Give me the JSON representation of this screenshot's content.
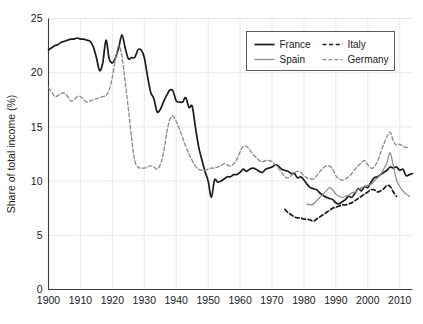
{
  "chart_data": {
    "type": "line",
    "title": "",
    "xlabel": "",
    "ylabel": "Share of total income (%)",
    "xlim": [
      1900,
      2014
    ],
    "ylim": [
      0,
      25
    ],
    "grid": true,
    "legend_position": "top-right",
    "x_ticks": [
      "1900",
      "1910",
      "1920",
      "1930",
      "1940",
      "1950",
      "1960",
      "1970",
      "1980",
      "1990",
      "2000",
      "2010"
    ],
    "y_ticks": [
      "0",
      "5",
      "10",
      "15",
      "20",
      "25"
    ],
    "legend_entries": [
      {
        "name": "France",
        "style": "solid",
        "color": "#1a1a1a"
      },
      {
        "name": "Italy",
        "style": "dashed",
        "color": "#1a1a1a"
      },
      {
        "name": "Spain",
        "style": "solid",
        "color": "#8c8c8c"
      },
      {
        "name": "Germany",
        "style": "dashed",
        "color": "#8c8c8c"
      }
    ],
    "series": [
      {
        "name": "France",
        "style": "solid",
        "color": "#1a1a1a",
        "x": [
          1900,
          1901,
          1902,
          1903,
          1904,
          1905,
          1906,
          1907,
          1908,
          1909,
          1910,
          1911,
          1912,
          1913,
          1914,
          1915,
          1916,
          1917,
          1918,
          1919,
          1920,
          1921,
          1922,
          1923,
          1924,
          1925,
          1926,
          1927,
          1928,
          1929,
          1930,
          1931,
          1932,
          1933,
          1934,
          1935,
          1936,
          1937,
          1938,
          1939,
          1940,
          1941,
          1942,
          1943,
          1944,
          1945,
          1946,
          1947,
          1948,
          1949,
          1950,
          1951,
          1952,
          1953,
          1954,
          1955,
          1956,
          1957,
          1958,
          1959,
          1960,
          1961,
          1962,
          1963,
          1964,
          1965,
          1966,
          1967,
          1968,
          1969,
          1970,
          1971,
          1972,
          1973,
          1974,
          1975,
          1976,
          1977,
          1978,
          1979,
          1980,
          1981,
          1982,
          1983,
          1984,
          1985,
          1986,
          1987,
          1988,
          1989,
          1990,
          1991,
          1992,
          1993,
          1994,
          1995,
          1996,
          1997,
          1998,
          1999,
          2000,
          2001,
          2002,
          2003,
          2004,
          2005,
          2006,
          2007,
          2008,
          2009,
          2010,
          2011,
          2012,
          2013,
          2014
        ],
        "y": [
          22.1,
          22.3,
          22.5,
          22.6,
          22.8,
          22.9,
          23.0,
          23.1,
          23.1,
          23.2,
          23.1,
          23.1,
          23.0,
          22.9,
          22.4,
          21.4,
          20.2,
          20.9,
          23.0,
          21.3,
          20.9,
          21.4,
          22.3,
          23.5,
          22.3,
          21.3,
          21.4,
          21.4,
          22.1,
          22.1,
          21.4,
          19.7,
          18.2,
          17.6,
          16.4,
          16.6,
          17.3,
          17.9,
          18.4,
          18.3,
          17.4,
          17.3,
          17.3,
          17.7,
          16.8,
          16.9,
          15.0,
          13.2,
          12.0,
          10.9,
          10.0,
          8.5,
          10.1,
          9.9,
          10.0,
          10.2,
          10.4,
          10.4,
          10.6,
          10.6,
          10.8,
          11.1,
          10.9,
          11.1,
          11.2,
          11.1,
          10.9,
          10.8,
          11.1,
          11.2,
          11.3,
          11.5,
          11.4,
          11.1,
          11.0,
          10.9,
          10.7,
          10.7,
          10.3,
          10.4,
          10.1,
          9.7,
          9.4,
          9.3,
          9.2,
          8.9,
          8.7,
          8.5,
          8.4,
          8.3,
          8.0,
          7.9,
          8.1,
          8.3,
          8.6,
          8.5,
          8.9,
          9.3,
          9.1,
          9.5,
          9.4,
          9.9,
          10.3,
          10.4,
          10.6,
          10.8,
          11.0,
          11.3,
          11.2,
          11.3,
          11.0,
          11.1,
          10.5,
          10.6,
          10.7
        ]
      },
      {
        "name": "Germany",
        "style": "dashed",
        "color": "#8c8c8c",
        "x": [
          1900,
          1901,
          1902,
          1903,
          1904,
          1905,
          1906,
          1907,
          1908,
          1909,
          1910,
          1911,
          1912,
          1913,
          1914,
          1915,
          1916,
          1917,
          1918,
          1919,
          1920,
          1921,
          1922,
          1923,
          1924,
          1925,
          1926,
          1927,
          1928,
          1929,
          1930,
          1931,
          1932,
          1933,
          1934,
          1935,
          1936,
          1937,
          1938,
          1939,
          1940,
          1941,
          1942,
          1943,
          1944,
          1945,
          1946,
          1947,
          1948,
          1949,
          1950,
          1951,
          1952,
          1953,
          1954,
          1955,
          1956,
          1957,
          1958,
          1959,
          1960,
          1961,
          1962,
          1963,
          1964,
          1965,
          1966,
          1967,
          1968,
          1969,
          1970,
          1971,
          1972,
          1973,
          1974,
          1975,
          1976,
          1977,
          1978,
          1979,
          1980,
          1981,
          1982,
          1983,
          1984,
          1985,
          1986,
          1987,
          1988,
          1989,
          1990,
          1991,
          1992,
          1993,
          1994,
          1995,
          1996,
          1997,
          1998,
          1999,
          2000,
          2001,
          2002,
          2003,
          2004,
          2005,
          2006,
          2007,
          2008,
          2009,
          2010,
          2011,
          2012,
          2013
        ],
        "y": [
          18.6,
          18.2,
          17.8,
          17.9,
          18.1,
          18.1,
          17.8,
          17.4,
          17.5,
          17.8,
          17.8,
          17.5,
          17.3,
          17.4,
          17.5,
          17.6,
          17.7,
          17.8,
          17.9,
          18.4,
          19.6,
          21.3,
          22.5,
          21.5,
          19.2,
          16.7,
          14.0,
          11.9,
          11.3,
          11.2,
          11.2,
          11.3,
          11.4,
          11.3,
          11.1,
          11.5,
          12.6,
          14.4,
          15.7,
          16.0,
          15.5,
          14.8,
          14.0,
          13.2,
          12.5,
          11.9,
          11.4,
          11.1,
          11.0,
          11.0,
          11.1,
          11.2,
          11.2,
          11.3,
          11.4,
          11.6,
          11.5,
          11.4,
          11.6,
          12.0,
          12.7,
          13.2,
          13.2,
          12.9,
          12.5,
          12.2,
          11.9,
          11.8,
          11.9,
          11.9,
          11.8,
          11.5,
          11.2,
          10.8,
          10.4,
          10.3,
          10.5,
          10.8,
          10.9,
          10.8,
          10.5,
          10.3,
          10.2,
          10.2,
          10.5,
          10.9,
          11.2,
          11.4,
          11.4,
          11.1,
          10.5,
          10.2,
          10.1,
          10.2,
          10.4,
          10.7,
          11.1,
          11.4,
          11.7,
          11.9,
          11.5,
          11.2,
          11.3,
          11.8,
          12.6,
          13.4,
          14.1,
          14.5,
          13.7,
          13.3,
          13.4,
          13.2,
          13.1,
          13.1
        ]
      },
      {
        "name": "Italy",
        "style": "dashed",
        "color": "#1a1a1a",
        "x": [
          1974,
          1975,
          1976,
          1977,
          1978,
          1979,
          1980,
          1981,
          1982,
          1983,
          1984,
          1985,
          1986,
          1987,
          1988,
          1989,
          1990,
          1991,
          1992,
          1993,
          1994,
          1995,
          1996,
          1997,
          1998,
          1999,
          2000,
          2001,
          2002,
          2003,
          2004,
          2005,
          2006,
          2007,
          2008,
          2009
        ],
        "y": [
          7.4,
          7.1,
          6.9,
          6.7,
          6.6,
          6.6,
          6.5,
          6.5,
          6.4,
          6.3,
          6.5,
          6.7,
          6.9,
          7.1,
          7.3,
          7.5,
          7.6,
          7.7,
          7.8,
          7.8,
          7.9,
          8.0,
          8.2,
          8.4,
          8.6,
          8.8,
          9.0,
          9.2,
          9.2,
          9.0,
          9.1,
          9.3,
          9.6,
          9.5,
          9.0,
          8.6
        ]
      },
      {
        "name": "Spain",
        "style": "solid",
        "color": "#8c8c8c",
        "x": [
          1981,
          1982,
          1983,
          1984,
          1985,
          1986,
          1987,
          1988,
          1989,
          1990,
          1991,
          1992,
          1993,
          1994,
          1995,
          1996,
          1997,
          1998,
          1999,
          2000,
          2001,
          2002,
          2003,
          2004,
          2005,
          2006,
          2007,
          2008,
          2009,
          2010,
          2011,
          2012,
          2013
        ],
        "y": [
          7.9,
          7.8,
          7.9,
          8.2,
          8.5,
          8.8,
          9.1,
          9.4,
          9.2,
          8.8,
          8.6,
          8.5,
          8.6,
          8.7,
          8.9,
          9.0,
          9.2,
          9.4,
          9.5,
          9.6,
          9.7,
          10.0,
          10.3,
          10.6,
          11.1,
          11.7,
          12.6,
          11.4,
          10.1,
          9.5,
          9.1,
          8.8,
          8.6
        ]
      }
    ]
  }
}
